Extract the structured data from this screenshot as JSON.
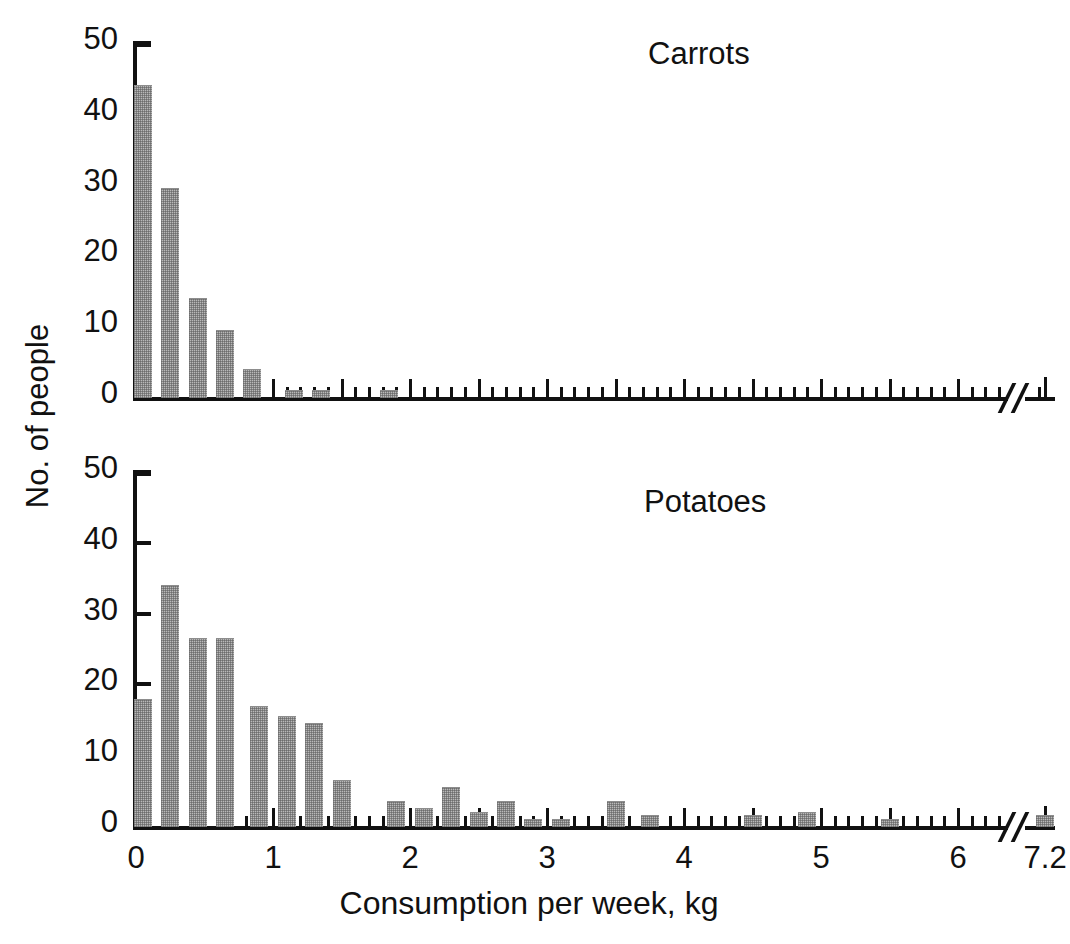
{
  "figure": {
    "xaxis_title": "Consumption per week, kg",
    "yaxis_title": "No. of people"
  },
  "chart_data": [
    {
      "type": "bar",
      "title": "Carrots",
      "xlabel": "Consumption per week, kg",
      "ylabel": "No. of people",
      "xlim": [
        0,
        7.3
      ],
      "ylim": [
        0,
        50
      ],
      "ytick_labels": [
        "0",
        "10",
        "20",
        "30",
        "40",
        "50"
      ],
      "ytick_values": [
        0,
        10,
        20,
        30,
        40,
        50
      ],
      "xtick_labels": [
        "0",
        "1",
        "2",
        "3",
        "4",
        "5",
        "6",
        "7.2"
      ],
      "xtick_values": [
        0,
        1,
        2,
        3,
        4,
        5,
        6,
        7.2
      ],
      "axis_break_after": 6.3,
      "bin_width": 0.1,
      "grid": false,
      "legend": "none",
      "x": [
        0.05,
        0.25,
        0.45,
        0.65,
        0.85,
        1.15,
        1.35,
        1.85
      ],
      "values": [
        44,
        29.5,
        14,
        9.5,
        4,
        1,
        1,
        1
      ]
    },
    {
      "type": "bar",
      "title": "Potatoes",
      "xlabel": "Consumption per week, kg",
      "ylabel": "No. of people",
      "xlim": [
        0,
        7.3
      ],
      "ylim": [
        0,
        50
      ],
      "ytick_labels": [
        "0",
        "10",
        "20",
        "30",
        "40",
        "50"
      ],
      "ytick_values": [
        0,
        10,
        20,
        30,
        40,
        50
      ],
      "xtick_labels": [
        "0",
        "1",
        "2",
        "3",
        "4",
        "5",
        "6",
        "7.2"
      ],
      "xtick_values": [
        0,
        1,
        2,
        3,
        4,
        5,
        6,
        7.2
      ],
      "axis_break_after": 6.3,
      "bin_width": 0.1,
      "grid": false,
      "legend": "none",
      "x": [
        0.05,
        0.25,
        0.45,
        0.65,
        0.9,
        1.1,
        1.3,
        1.5,
        1.9,
        2.1,
        2.3,
        2.5,
        2.7,
        2.9,
        3.1,
        3.5,
        3.75,
        4.5,
        4.9,
        5.5,
        7.2
      ],
      "values": [
        18,
        34,
        26.5,
        26.5,
        17,
        15.5,
        14.5,
        6.5,
        3.5,
        2.5,
        5.5,
        2,
        3.5,
        1,
        1,
        3.5,
        1.5,
        1.5,
        2,
        1,
        1.5
      ]
    }
  ]
}
